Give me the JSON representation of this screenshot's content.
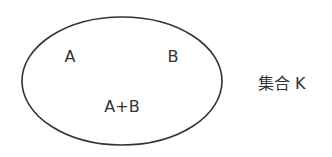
{
  "diagram": {
    "set_name": "集合 K",
    "elements": [
      {
        "label": "A",
        "x": 70,
        "y": 62
      },
      {
        "label": "B",
        "x": 173,
        "y": 62
      },
      {
        "label": "A+B",
        "x": 122,
        "y": 112
      }
    ],
    "ellipse": {
      "cx": 122,
      "cy": 81,
      "rx": 100,
      "ry": 64,
      "stroke": "#333333"
    }
  }
}
